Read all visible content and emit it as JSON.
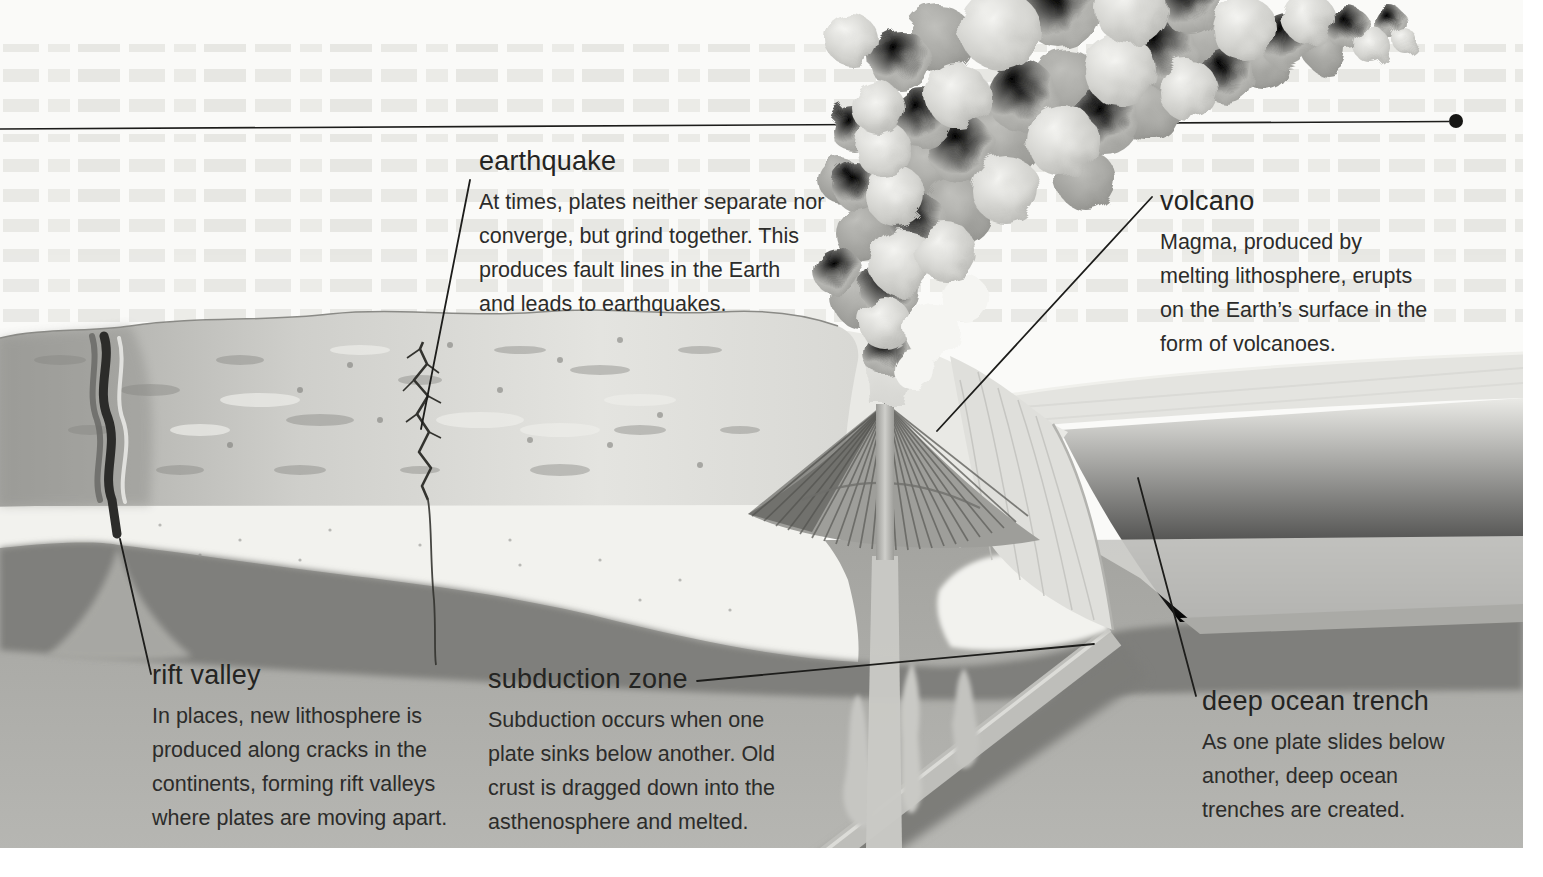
{
  "figure": {
    "kind": "plate-tectonics-cross-section",
    "annotations": {
      "earthquake": {
        "title": "earthquake",
        "lines": [
          "At times, plates neither separate nor",
          "converge, but grind together. This",
          "produces fault lines in the Earth",
          "and leads to earthquakes."
        ]
      },
      "volcano": {
        "title": "volcano",
        "lines": [
          "Magma, produced by",
          "melting lithosphere, erupts",
          "on the Earth’s surface in the",
          "form of volcanoes."
        ]
      },
      "rift_valley": {
        "title": "rift valley",
        "lines": [
          "In places, new lithosphere is",
          "produced along cracks in the",
          "continents, forming rift valleys",
          "where plates are moving apart."
        ]
      },
      "subduction_zone": {
        "title": "subduction zone",
        "lines": [
          "Subduction occurs when one",
          "plate sinks below another. Old",
          "crust is dragged down into the",
          "asthenosphere and melted."
        ]
      },
      "deep_ocean_trench": {
        "title": "deep ocean trench",
        "lines": [
          "As one plate slides below",
          "another, deep ocean",
          "trenches are created."
        ]
      }
    },
    "palette": {
      "page": "#fafaf8",
      "text": "#262624",
      "leader_line": "#1d1d1b",
      "lithosphere_light": "#f2f2ee",
      "asthenosphere_dark": "#7f7f7b",
      "mantle_mid": "#aeaeaa",
      "terrain_gray": "#c9c9c5",
      "ocean_light": "#e4e4e0",
      "plume_gray": "#b3b3af"
    }
  }
}
